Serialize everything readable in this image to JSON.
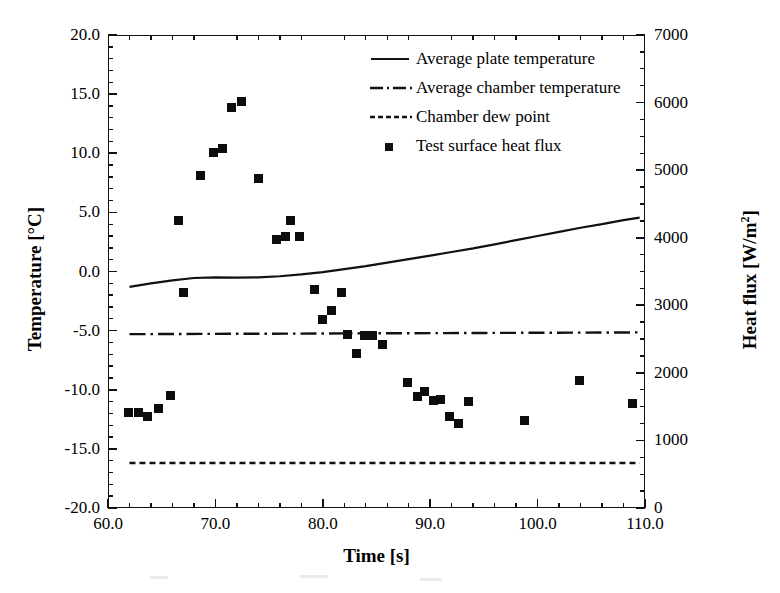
{
  "chart_data": {
    "type": "scatter",
    "title": "",
    "xlabel": "Time [s]",
    "ylabel": "Temperature [°C]",
    "y2label": "Heat flux [W/m²]",
    "xlim": [
      60.0,
      110.0
    ],
    "ylim": [
      -20.0,
      20.0
    ],
    "y2lim": [
      0,
      7000
    ],
    "xticks": [
      60.0,
      70.0,
      80.0,
      90.0,
      100.0,
      110.0
    ],
    "xticklabels": [
      "60.0",
      "70.0",
      "80.0",
      "90.0",
      "100.0",
      "110.0"
    ],
    "x_minor_step": 2.0,
    "yticks": [
      -20.0,
      -15.0,
      -10.0,
      -5.0,
      0.0,
      5.0,
      10.0,
      15.0,
      20.0
    ],
    "yticklabels": [
      "-20.0",
      "-15.0",
      "-10.0",
      "-5.0",
      "0.0",
      "5.0",
      "10.0",
      "15.0",
      "20.0"
    ],
    "y_minor_step": 1.0,
    "y2ticks": [
      0,
      1000,
      2000,
      3000,
      4000,
      5000,
      6000,
      7000
    ],
    "y2ticklabels": [
      "0",
      "1000",
      "2000",
      "3000",
      "4000",
      "5000",
      "6000",
      "7000"
    ],
    "y2_minor_step": 250,
    "grid": false,
    "legend_position": "upper-right-inside",
    "series": [
      {
        "name": "Average plate temperature",
        "key": "average-plate-temperature",
        "style": "solid",
        "axis": "left",
        "x": [
          62.0,
          64.0,
          66.0,
          68.0,
          70.0,
          72.0,
          74.0,
          76.0,
          78.0,
          80.0,
          82.0,
          84.0,
          86.0,
          88.0,
          90.0,
          92.0,
          94.0,
          96.0,
          98.0,
          100.0,
          102.0,
          104.0,
          106.0,
          108.0,
          109.5
        ],
        "y": [
          -1.3,
          -1.0,
          -0.75,
          -0.55,
          -0.5,
          -0.52,
          -0.5,
          -0.4,
          -0.25,
          -0.05,
          0.2,
          0.45,
          0.75,
          1.05,
          1.35,
          1.65,
          1.95,
          2.3,
          2.65,
          3.0,
          3.35,
          3.7,
          4.0,
          4.35,
          4.55
        ]
      },
      {
        "name": "Average chamber temperature",
        "key": "average-chamber-temperature",
        "style": "dashdot",
        "axis": "left",
        "x": [
          62.0,
          109.5
        ],
        "y": [
          -5.3,
          -5.15
        ]
      },
      {
        "name": "Chamber dew point",
        "key": "chamber-dew-point",
        "style": "dashed",
        "axis": "left",
        "x": [
          62.0,
          109.5
        ],
        "y": [
          -16.2,
          -16.2
        ]
      },
      {
        "name": "Test surface heat flux",
        "key": "test-surface-heat-flux",
        "style": "marker-square",
        "axis": "right",
        "points": [
          {
            "x": 61.9,
            "temp_equiv": -11.9,
            "heat_flux": 1420
          },
          {
            "x": 62.8,
            "temp_equiv": -11.9,
            "heat_flux": 1420
          },
          {
            "x": 63.7,
            "temp_equiv": -12.3,
            "heat_flux": 1350
          },
          {
            "x": 64.7,
            "temp_equiv": -11.6,
            "heat_flux": 1470
          },
          {
            "x": 65.8,
            "temp_equiv": -10.5,
            "heat_flux": 1660
          },
          {
            "x": 66.6,
            "temp_equiv": 4.35,
            "heat_flux": 4260
          },
          {
            "x": 67.0,
            "temp_equiv": -1.8,
            "heat_flux": 3190
          },
          {
            "x": 68.6,
            "temp_equiv": 8.1,
            "heat_flux": 4920
          },
          {
            "x": 69.8,
            "temp_equiv": 10.05,
            "heat_flux": 5260
          },
          {
            "x": 70.7,
            "temp_equiv": 10.4,
            "heat_flux": 5320
          },
          {
            "x": 71.5,
            "temp_equiv": 13.8,
            "heat_flux": 5920
          },
          {
            "x": 72.4,
            "temp_equiv": 14.4,
            "heat_flux": 6020
          },
          {
            "x": 74.0,
            "temp_equiv": 7.85,
            "heat_flux": 4870
          },
          {
            "x": 75.7,
            "temp_equiv": 2.75,
            "heat_flux": 3980
          },
          {
            "x": 76.5,
            "temp_equiv": 3.0,
            "heat_flux": 4020
          },
          {
            "x": 77.0,
            "temp_equiv": 4.35,
            "heat_flux": 4260
          },
          {
            "x": 77.8,
            "temp_equiv": 3.0,
            "heat_flux": 4020
          },
          {
            "x": 79.2,
            "temp_equiv": -1.5,
            "heat_flux": 3240
          },
          {
            "x": 80.0,
            "temp_equiv": -4.05,
            "heat_flux": 2790
          },
          {
            "x": 80.8,
            "temp_equiv": -3.35,
            "heat_flux": 2920
          },
          {
            "x": 81.7,
            "temp_equiv": -1.8,
            "heat_flux": 3190
          },
          {
            "x": 82.3,
            "temp_equiv": -5.3,
            "heat_flux": 2570
          },
          {
            "x": 83.1,
            "temp_equiv": -6.9,
            "heat_flux": 2290
          },
          {
            "x": 83.9,
            "temp_equiv": -5.4,
            "heat_flux": 2550
          },
          {
            "x": 84.6,
            "temp_equiv": -5.35,
            "heat_flux": 2560
          },
          {
            "x": 85.6,
            "temp_equiv": -6.2,
            "heat_flux": 2420
          },
          {
            "x": 87.9,
            "temp_equiv": -9.4,
            "heat_flux": 1860
          },
          {
            "x": 88.8,
            "temp_equiv": -10.6,
            "heat_flux": 1650
          },
          {
            "x": 89.5,
            "temp_equiv": -10.2,
            "heat_flux": 1720
          },
          {
            "x": 90.3,
            "temp_equiv": -10.9,
            "heat_flux": 1590
          },
          {
            "x": 91.0,
            "temp_equiv": -10.8,
            "heat_flux": 1610
          },
          {
            "x": 91.8,
            "temp_equiv": -12.3,
            "heat_flux": 1350
          },
          {
            "x": 92.6,
            "temp_equiv": -12.85,
            "heat_flux": 1250
          },
          {
            "x": 93.6,
            "temp_equiv": -10.95,
            "heat_flux": 1580
          },
          {
            "x": 98.8,
            "temp_equiv": -12.6,
            "heat_flux": 1300
          },
          {
            "x": 103.9,
            "temp_equiv": -9.25,
            "heat_flux": 1880
          },
          {
            "x": 108.8,
            "temp_equiv": -11.2,
            "heat_flux": 1540
          }
        ]
      }
    ],
    "legend": [
      {
        "label": "Average plate temperature",
        "marker": "solid-line"
      },
      {
        "label": "Average chamber temperature",
        "marker": "dash-dot-line"
      },
      {
        "label": "Chamber dew point",
        "marker": "dashed-line"
      },
      {
        "label": "Test surface heat flux",
        "marker": "filled-square"
      }
    ],
    "colors": {
      "line": "#111111",
      "marker": "#0d0d0d",
      "axis": "#111111",
      "background": "#ffffff"
    }
  }
}
